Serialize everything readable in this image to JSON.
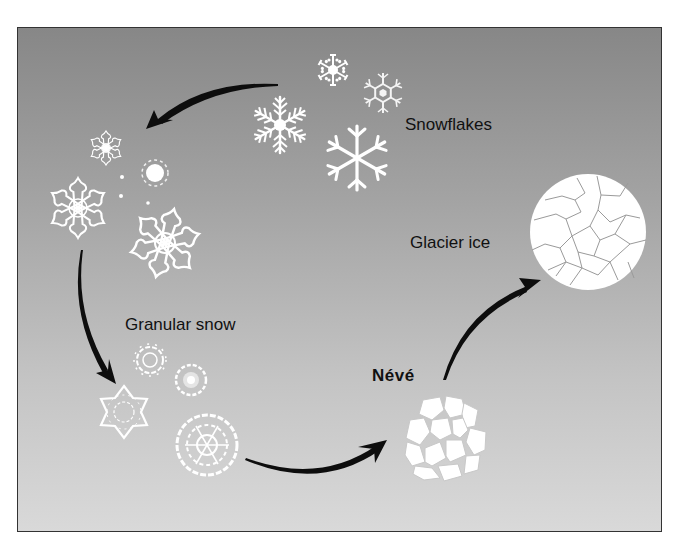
{
  "diagram": {
    "stages": [
      {
        "id": "snowflakes",
        "label": "Snowflakes"
      },
      {
        "id": "granular-snow",
        "label": "Granular snow"
      },
      {
        "id": "neve",
        "label": "Névé"
      },
      {
        "id": "glacier-ice",
        "label": "Glacier ice"
      }
    ],
    "arrows": [
      {
        "from": "snowflakes",
        "to": "granular-snow-top"
      },
      {
        "from": "granular-snow-top",
        "to": "granular-snow-bottom"
      },
      {
        "from": "granular-snow-bottom",
        "to": "neve"
      },
      {
        "from": "neve",
        "to": "glacier-ice"
      }
    ],
    "colors": {
      "background_top": "#878787",
      "background_bottom": "#d9d9d9",
      "crystal": "#ffffff",
      "arrow": "#0d0d0d",
      "text": "#111111"
    }
  }
}
